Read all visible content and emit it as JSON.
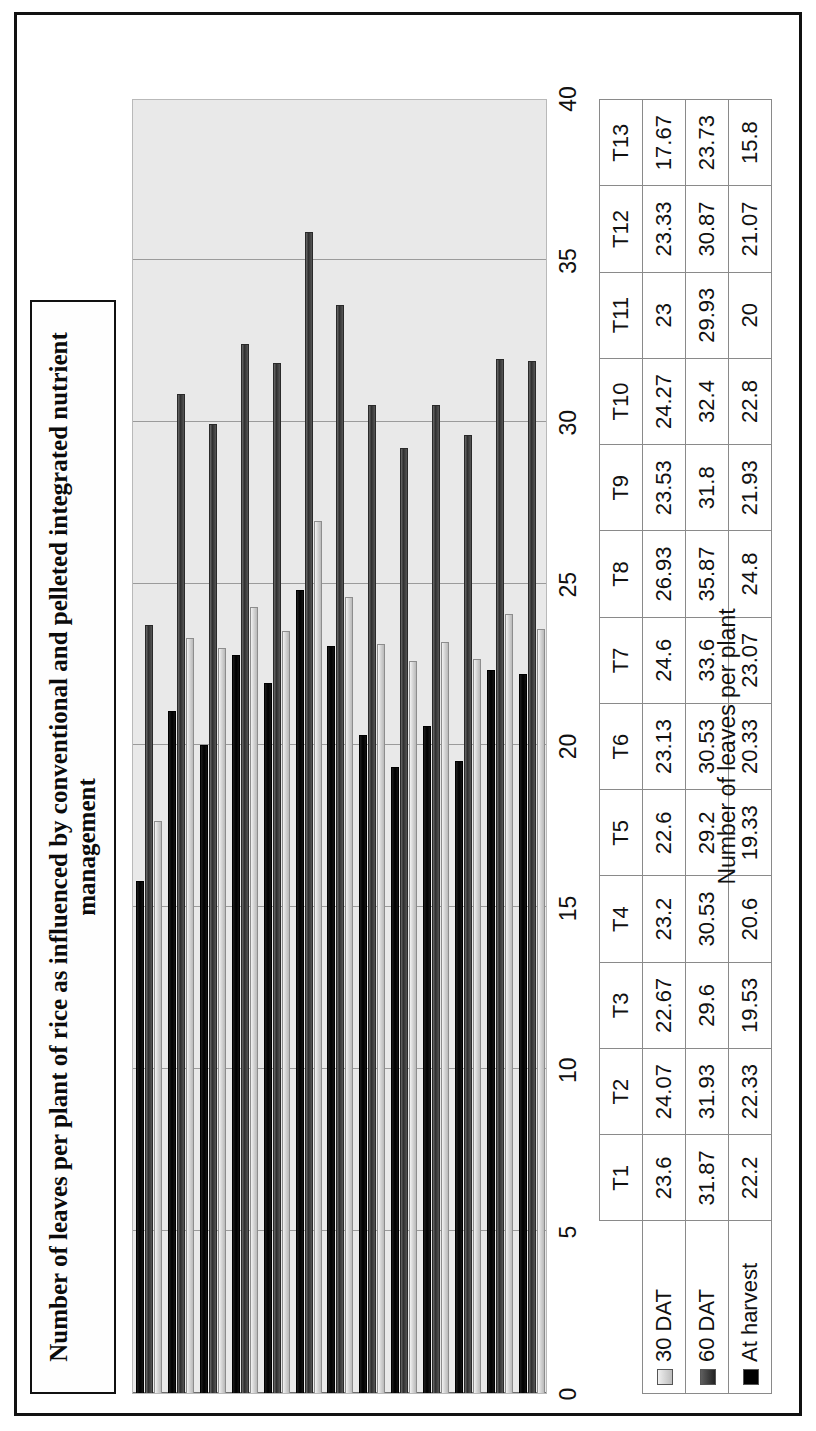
{
  "chart_data": {
    "type": "bar",
    "orientation": "horizontal",
    "title": "Number of leaves per plant of rice as influenced by conventional and pelleted integrated nutrient management",
    "xlabel": "",
    "ylabel": "Number of leaves per plant",
    "axis_title": "Number of leaves per plant",
    "ylim": [
      0,
      40
    ],
    "tick_step": 5,
    "ticks": [
      "0",
      "5",
      "10",
      "15",
      "20",
      "25",
      "30",
      "35",
      "40"
    ],
    "grid": true,
    "legend_position": "bottom-table",
    "categories": [
      "T1",
      "T2",
      "T3",
      "T4",
      "T5",
      "T6",
      "T7",
      "T8",
      "T9",
      "T10",
      "T11",
      "T12",
      "T13"
    ],
    "series": [
      {
        "name": "30 DAT",
        "values": [
          23.6,
          24.07,
          22.67,
          23.2,
          22.6,
          23.13,
          24.6,
          26.93,
          23.53,
          24.27,
          23,
          23.33,
          17.67
        ]
      },
      {
        "name": "60 DAT",
        "values": [
          31.87,
          31.93,
          29.6,
          30.53,
          29.2,
          30.53,
          33.6,
          35.87,
          31.8,
          32.4,
          29.93,
          30.87,
          23.73
        ]
      },
      {
        "name": "At harvest",
        "values": [
          22.2,
          22.33,
          19.53,
          20.6,
          19.33,
          20.33,
          23.07,
          24.8,
          21.93,
          22.8,
          20,
          21.07,
          15.8
        ]
      }
    ],
    "series_labels_display": [
      [
        "23.6",
        "24.07",
        "22.67",
        "23.2",
        "22.6",
        "23.13",
        "24.6",
        "26.93",
        "23.53",
        "24.27",
        "23",
        "23.33",
        "17.67"
      ],
      [
        "31.87",
        "31.93",
        "29.6",
        "30.53",
        "29.2",
        "30.53",
        "33.6",
        "35.87",
        "31.8",
        "32.4",
        "29.93",
        "30.87",
        "23.73"
      ],
      [
        "22.2",
        "22.33",
        "19.53",
        "20.6",
        "19.33",
        "20.33",
        "23.07",
        "24.8",
        "21.93",
        "22.8",
        "20",
        "21.07",
        "15.8"
      ]
    ],
    "colors": {
      "series_30dat": "#d6d6d6",
      "series_60dat": "#3a3a3a",
      "series_harvest": "#000000",
      "plot_background": "#e9e9e9",
      "gridline": "#9b9b9b",
      "text": "#111111"
    }
  }
}
